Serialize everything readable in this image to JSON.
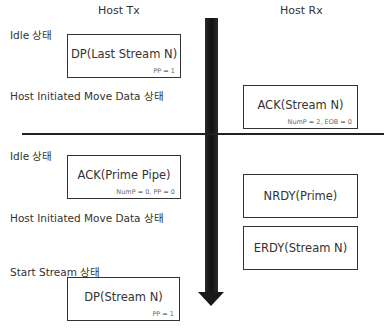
{
  "columns": {
    "tx": "Host Tx",
    "rx": "Host Rx"
  },
  "states": [
    {
      "label": "Idle 상태"
    },
    {
      "label": "Host Initiated Move Data  상태"
    },
    {
      "label": "Idle 상태"
    },
    {
      "label": "Host Initiated Move Data  상태"
    },
    {
      "label": "Start Stream 상태"
    }
  ],
  "packets": [
    {
      "main": "DP(Last Stream N)",
      "sub": "PP = 1",
      "side": "tx"
    },
    {
      "main": "ACK(Stream N)",
      "sub": "NumP = 2, EOB = 0",
      "side": "rx"
    },
    {
      "main": "ACK(Prime Pipe)",
      "sub": "NumP = 0, PP = 0",
      "side": "tx"
    },
    {
      "main": "NRDY(Prime)",
      "sub": "",
      "side": "rx"
    },
    {
      "main": "ERDY(Stream N)",
      "sub": "",
      "side": "rx"
    },
    {
      "main": "DP(Stream N)",
      "sub": "PP = 1",
      "side": "tx"
    }
  ],
  "arrow": {
    "direction": "down",
    "meaning": "time"
  },
  "colors": {
    "line": "#222222",
    "arrow": "#1a1a1a",
    "box_border": "#333333"
  }
}
